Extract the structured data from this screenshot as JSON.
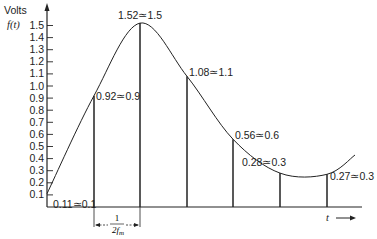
{
  "chart_data": {
    "type": "line",
    "title": "",
    "ylabel": "Volts",
    "ylabel_sub": "f(t)",
    "xlabel": "t",
    "ylim": [
      0,
      1.6
    ],
    "yticks": [
      "0.1",
      "0.2",
      "0.3",
      "0.4",
      "0.5",
      "0.6",
      "0.7",
      "0.8",
      "0.9",
      "1.0",
      "1.1",
      "1.2",
      "1.3",
      "1.4",
      "1.5"
    ],
    "grid": false,
    "series": [
      {
        "name": "f(t)",
        "description": "continuous signal sampled at interval 1/(2f_m)",
        "samples": [
          {
            "index": 0,
            "value": 0.11,
            "rounded": 0.1,
            "label": "0.11≃0.1"
          },
          {
            "index": 1,
            "value": 0.92,
            "rounded": 0.9,
            "label": "0.92≃0.9"
          },
          {
            "index": 2,
            "value": 1.52,
            "rounded": 1.5,
            "label": "1.52≃1.5"
          },
          {
            "index": 3,
            "value": 1.08,
            "rounded": 1.1,
            "label": "1.08≃1.1"
          },
          {
            "index": 4,
            "value": 0.56,
            "rounded": 0.6,
            "label": "0.56≃0.6"
          },
          {
            "index": 5,
            "value": 0.28,
            "rounded": 0.3,
            "label": "0.28≃0.3"
          },
          {
            "index": 6,
            "value": 0.27,
            "rounded": 0.3,
            "label": "0.27≃0.3"
          }
        ]
      }
    ],
    "annotations": [
      {
        "text": "1 / 2f_m",
        "description": "sampling interval dimension arrow between first two samples"
      }
    ]
  },
  "labels": {
    "ylabel": "Volts",
    "ylabel_sub": "f(t)",
    "xlabel": "t",
    "interval_num": "1",
    "interval_den": "2f",
    "interval_den_sub": "m"
  }
}
